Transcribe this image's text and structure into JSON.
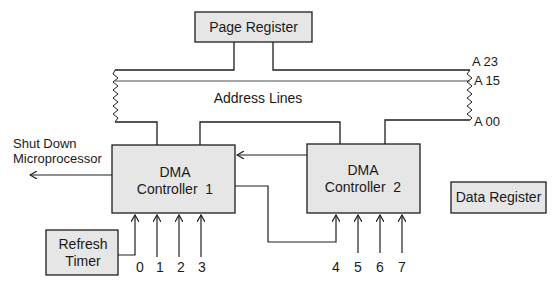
{
  "diagram": {
    "colors": {
      "box_fill": "#e6e6e6",
      "stroke": "#1e1e1e",
      "background": "#ffffff"
    },
    "blocks": {
      "page_register": "Page Register",
      "dma1_line1": "DMA",
      "dma1_line2": "Controller  1",
      "dma2_line1": "DMA",
      "dma2_line2": "Controller  2",
      "data_register": "Data Register",
      "refresh_line1": "Refresh",
      "refresh_line2": "Timer"
    },
    "bus": {
      "label": "Address Lines",
      "a23": "A 23",
      "a15": "A 15",
      "a00": "A 00"
    },
    "output": {
      "line1": "Shut Down",
      "line2": "Microprocessor"
    },
    "channels": [
      "0",
      "1",
      "2",
      "3",
      "4",
      "5",
      "6",
      "7"
    ]
  }
}
